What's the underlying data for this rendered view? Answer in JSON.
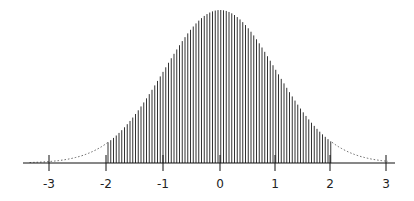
{
  "chart_data": {
    "type": "area",
    "title": "",
    "subtitle": "",
    "xlabel": "",
    "ylabel": "",
    "x_ticks": [
      "-3",
      "-2",
      "-1",
      "0",
      "1",
      "2",
      "3"
    ],
    "xlim": [
      -3.3,
      3.1
    ],
    "ylim": [
      0,
      0.4
    ],
    "grid": false,
    "legend": null,
    "curve": {
      "function": "standard normal pdf",
      "mean": 0,
      "sd": 1
    },
    "shaded_region": {
      "from": -2,
      "to": 2,
      "style": "vertical hatch lines",
      "proportion": 0.9545
    },
    "tails_style": "dotted",
    "series": [
      {
        "name": "density",
        "x": [
          -3,
          -2,
          -1,
          0,
          1,
          2,
          3
        ],
        "values": [
          0.0044,
          0.054,
          0.242,
          0.399,
          0.242,
          0.054,
          0.0044
        ]
      }
    ],
    "colors": {
      "line": "#222222",
      "hatch": "#333333",
      "axis": "#111111",
      "background": "#ffffff"
    }
  }
}
